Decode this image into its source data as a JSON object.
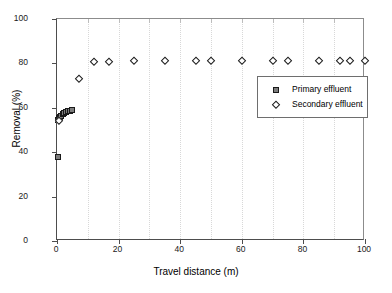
{
  "chart_data": {
    "type": "scatter",
    "title": "",
    "xlabel": "Travel distance (m)",
    "ylabel": "Removal (%)",
    "xlim": [
      0,
      100
    ],
    "ylim": [
      0,
      100
    ],
    "xticks": [
      0,
      20,
      40,
      60,
      80,
      100
    ],
    "yticks": [
      0,
      20,
      40,
      60,
      80,
      100
    ],
    "grid": "vertical dotted light-gray at 10 m intervals",
    "legend_position": "center-right inside plot",
    "series": [
      {
        "name": "Primary effluent",
        "marker": "filled-square",
        "color": "#7d7d7d",
        "edge_color": "#1a1a1a",
        "points": [
          {
            "x": 0.2,
            "y": 38.0
          },
          {
            "x": 0.4,
            "y": 54.5
          },
          {
            "x": 0.7,
            "y": 55.2
          },
          {
            "x": 1.0,
            "y": 55.8
          },
          {
            "x": 1.4,
            "y": 56.4
          },
          {
            "x": 1.8,
            "y": 57.0
          },
          {
            "x": 2.3,
            "y": 57.5
          },
          {
            "x": 2.9,
            "y": 58.0
          },
          {
            "x": 3.5,
            "y": 58.4
          },
          {
            "x": 4.2,
            "y": 58.7
          },
          {
            "x": 5.0,
            "y": 59.0
          }
        ]
      },
      {
        "name": "Secondary effluent",
        "marker": "open-diamond",
        "color": "#ffffff",
        "edge_color": "#1a1a1a",
        "points": [
          {
            "x": 0.5,
            "y": 54.0
          },
          {
            "x": 7.0,
            "y": 73.0
          },
          {
            "x": 12.0,
            "y": 80.5
          },
          {
            "x": 17.0,
            "y": 80.7
          },
          {
            "x": 25.0,
            "y": 81.0
          },
          {
            "x": 35.0,
            "y": 81.0
          },
          {
            "x": 45.0,
            "y": 81.0
          },
          {
            "x": 50.0,
            "y": 81.0
          },
          {
            "x": 60.0,
            "y": 81.0
          },
          {
            "x": 70.0,
            "y": 81.0
          },
          {
            "x": 75.0,
            "y": 81.0
          },
          {
            "x": 85.0,
            "y": 81.0
          },
          {
            "x": 92.0,
            "y": 81.0
          },
          {
            "x": 95.0,
            "y": 81.0
          },
          {
            "x": 100.0,
            "y": 81.0
          }
        ]
      }
    ]
  },
  "legend": {
    "entries": [
      {
        "label": "Primary effluent",
        "marker": "filled-square"
      },
      {
        "label": "Secondary effluent",
        "marker": "open-diamond"
      }
    ]
  },
  "colors": {
    "axis": "#4d4d4d",
    "grid": "#d8d8d8",
    "primary_marker_fill": "#7d7d7d",
    "marker_edge": "#1a1a1a",
    "background": "#ffffff"
  }
}
